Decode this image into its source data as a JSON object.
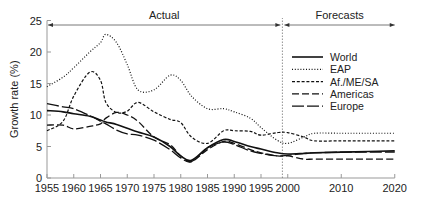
{
  "chart_data": {
    "type": "line",
    "title": "",
    "xlabel": "",
    "ylabel": "Growth rate (%)",
    "xlim": [
      1955,
      2020
    ],
    "ylim": [
      0,
      25
    ],
    "x_ticks": [
      "1955",
      "1960",
      "1965",
      "1970",
      "1975",
      "1980",
      "1985",
      "1990",
      "1995",
      "2000",
      "2010",
      "2020"
    ],
    "y_ticks": [
      "0",
      "5",
      "10",
      "15",
      "20",
      "25"
    ],
    "grid": false,
    "legend_position": "upper right",
    "annotations": [
      {
        "text": "Actual",
        "span": [
          1955,
          1999
        ]
      },
      {
        "text": "Forecasts",
        "span": [
          1999,
          2020
        ]
      }
    ],
    "divider_year": 1999,
    "x": [
      1955,
      1958,
      1960,
      1963,
      1965,
      1966,
      1968,
      1970,
      1972,
      1975,
      1978,
      1980,
      1982,
      1985,
      1988,
      1990,
      1993,
      1995,
      1998,
      2000,
      2003,
      2005,
      2010,
      2015,
      2020
    ],
    "series": [
      {
        "name": "World",
        "style": "solid",
        "values": [
          10.7,
          10.5,
          10.2,
          9.8,
          9.2,
          8.9,
          8.5,
          7.9,
          7.3,
          6.5,
          5.0,
          3.5,
          2.8,
          4.8,
          6.1,
          5.8,
          5.0,
          4.6,
          4.0,
          3.8,
          3.9,
          4.0,
          4.1,
          4.2,
          4.3
        ]
      },
      {
        "name": "EAP",
        "style": "dotted",
        "values": [
          14.5,
          16.0,
          17.5,
          20.0,
          21.5,
          22.8,
          21.5,
          18.0,
          14.0,
          14.0,
          16.3,
          15.5,
          13.0,
          11.0,
          11.0,
          10.5,
          9.5,
          8.0,
          6.0,
          5.5,
          6.5,
          7.1,
          7.1,
          7.1,
          7.1
        ]
      },
      {
        "name": "Af./ME/SA",
        "style": "short-dash",
        "values": [
          7.5,
          9.0,
          13.0,
          16.8,
          15.5,
          12.0,
          10.4,
          10.6,
          12.0,
          10.5,
          9.3,
          8.8,
          6.5,
          5.5,
          7.5,
          7.5,
          7.4,
          6.8,
          7.2,
          7.2,
          6.5,
          5.9,
          5.9,
          5.9,
          5.9
        ]
      },
      {
        "name": "Americas",
        "style": "long-dash",
        "values": [
          8.4,
          8.4,
          7.8,
          8.2,
          8.6,
          9.5,
          10.4,
          10.0,
          9.0,
          6.5,
          5.3,
          3.5,
          2.6,
          4.5,
          5.8,
          5.5,
          4.5,
          4.0,
          3.5,
          3.5,
          3.0,
          3.0,
          3.0,
          3.0,
          3.0
        ]
      },
      {
        "name": "Europe",
        "style": "dash-gap",
        "values": [
          11.8,
          11.3,
          11.0,
          9.9,
          9.0,
          8.6,
          7.6,
          7.0,
          6.8,
          6.0,
          4.5,
          3.2,
          2.6,
          4.8,
          5.7,
          5.3,
          4.3,
          3.9,
          3.5,
          3.6,
          3.9,
          4.0,
          4.1,
          4.1,
          4.1
        ]
      }
    ]
  }
}
